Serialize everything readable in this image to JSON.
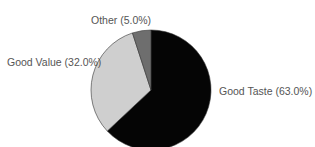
{
  "chart_data": {
    "type": "pie",
    "title": "",
    "start_angle_deg": 0,
    "direction": "clockwise",
    "slices": [
      {
        "label": "Good Taste",
        "value": 63.0,
        "display": "Good Taste (63.0%)",
        "color": "#050505"
      },
      {
        "label": "Good Value",
        "value": 32.0,
        "display": "Good Value (32.0%)",
        "color": "#cfcfcf"
      },
      {
        "label": "Other",
        "value": 5.0,
        "display": "Other (5.0%)",
        "color": "#6e6e6e"
      }
    ]
  },
  "labels": {
    "good_taste": "Good Taste (63.0%)",
    "good_value": "Good Value (32.0%)",
    "other": "Other (5.0%)"
  }
}
